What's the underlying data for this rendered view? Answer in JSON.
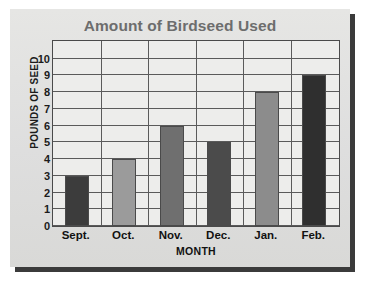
{
  "chart_data": {
    "type": "bar",
    "title": "Amount of Birdseed Used",
    "xlabel": "MONTH",
    "ylabel": "POUNDS OF SEED",
    "categories": [
      "Sept.",
      "Oct.",
      "Nov.",
      "Dec.",
      "Jan.",
      "Feb."
    ],
    "values": [
      3,
      4,
      6,
      5,
      8,
      9
    ],
    "bar_colors": [
      "#3c3c3c",
      "#9b9b9b",
      "#6f6f6f",
      "#4b4b4b",
      "#8c8c8c",
      "#2f2f2f"
    ],
    "ylim": [
      0,
      11
    ],
    "yticks": [
      10,
      9,
      8,
      7,
      6,
      5,
      4,
      3,
      2,
      1,
      0
    ],
    "ytick_labels": [
      "10",
      "9",
      "8",
      "7",
      "6",
      "5",
      "4",
      "3",
      "2",
      "1",
      "0"
    ],
    "grid": true,
    "grid_axis": "both",
    "legend": false,
    "title_color": "#6d6d6d",
    "plot_background": "#ededeb",
    "frame_color": "#4a4a4a",
    "gridline_color": "#5a5a5a"
  }
}
